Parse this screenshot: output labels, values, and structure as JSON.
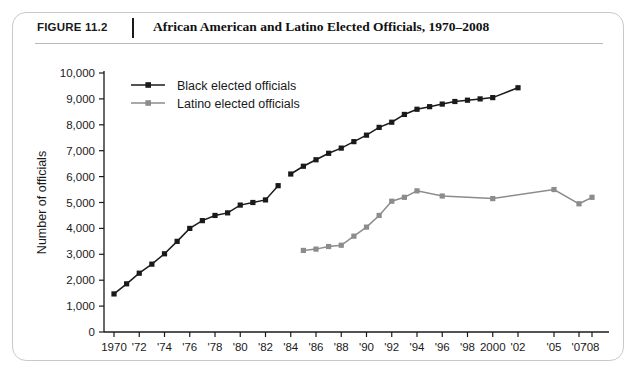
{
  "figure": {
    "number_label": "FIGURE 11.2",
    "title": "African American and Latino Elected Officials, 1970–2008"
  },
  "chart_data": {
    "type": "line",
    "title": "African American and Latino Elected Officials, 1970–2008",
    "xlabel": "",
    "ylabel": "Number of officials",
    "ylim": [
      0,
      10000
    ],
    "ytick_values": [
      0,
      1000,
      2000,
      3000,
      4000,
      5000,
      6000,
      7000,
      8000,
      9000,
      10000
    ],
    "ytick_labels": [
      "0",
      "1,000",
      "2,000",
      "3,000",
      "4,000",
      "5,000",
      "6,000",
      "7,000",
      "8,000",
      "9,000",
      "10,000"
    ],
    "xtick_labels": [
      "1970",
      "'72",
      "'74",
      "'76",
      "'78",
      "'80",
      "'82",
      "'84",
      "'86",
      "'88",
      "'90",
      "'92",
      "'94",
      "'96",
      "'98",
      "2000",
      "'02",
      "'05",
      "'07",
      "'08"
    ],
    "xtick_years": [
      1970,
      1972,
      1974,
      1976,
      1978,
      1980,
      1982,
      1984,
      1986,
      1988,
      1990,
      1992,
      1994,
      1996,
      1998,
      2000,
      2002,
      2005,
      2007,
      2008
    ],
    "grid": false,
    "legend_position": "top-left",
    "series": [
      {
        "name": "Black elected officials",
        "color": "#1a1a1a",
        "marker": "square",
        "segments": [
          {
            "x": [
              1970,
              1971,
              1972,
              1973,
              1974,
              1975,
              1976,
              1977,
              1978,
              1979,
              1980,
              1981,
              1982,
              1983
            ],
            "y": [
              1470,
              1860,
              2270,
              2620,
              3020,
              3500,
              4000,
              4300,
              4500,
              4600,
              4900,
              5000,
              5100,
              5650
            ]
          },
          {
            "x": [
              1984,
              1985,
              1986,
              1987,
              1988,
              1989,
              1990,
              1991,
              1992,
              1993,
              1994,
              1995,
              1996,
              1997,
              1998,
              1999,
              2000,
              2002
            ],
            "y": [
              6100,
              6400,
              6650,
              6900,
              7100,
              7350,
              7600,
              7900,
              8100,
              8400,
              8600,
              8700,
              8800,
              8900,
              8950,
              9000,
              9050,
              9430
            ]
          }
        ]
      },
      {
        "name": "Latino elected officials",
        "color": "#8c8c8c",
        "marker": "square",
        "segments": [
          {
            "x": [
              1985,
              1986,
              1987,
              1988,
              1989,
              1990,
              1991,
              1992,
              1993,
              1994,
              1996,
              2000,
              2005,
              2007,
              2008
            ],
            "y": [
              3150,
              3200,
              3300,
              3350,
              3700,
              4050,
              4500,
              5050,
              5200,
              5450,
              5250,
              5150,
              5500,
              4950,
              5200
            ]
          }
        ]
      }
    ]
  },
  "legend": {
    "items": [
      {
        "label": "Black elected officials",
        "color": "#1a1a1a"
      },
      {
        "label": "Latino elected officials",
        "color": "#8c8c8c"
      }
    ]
  }
}
